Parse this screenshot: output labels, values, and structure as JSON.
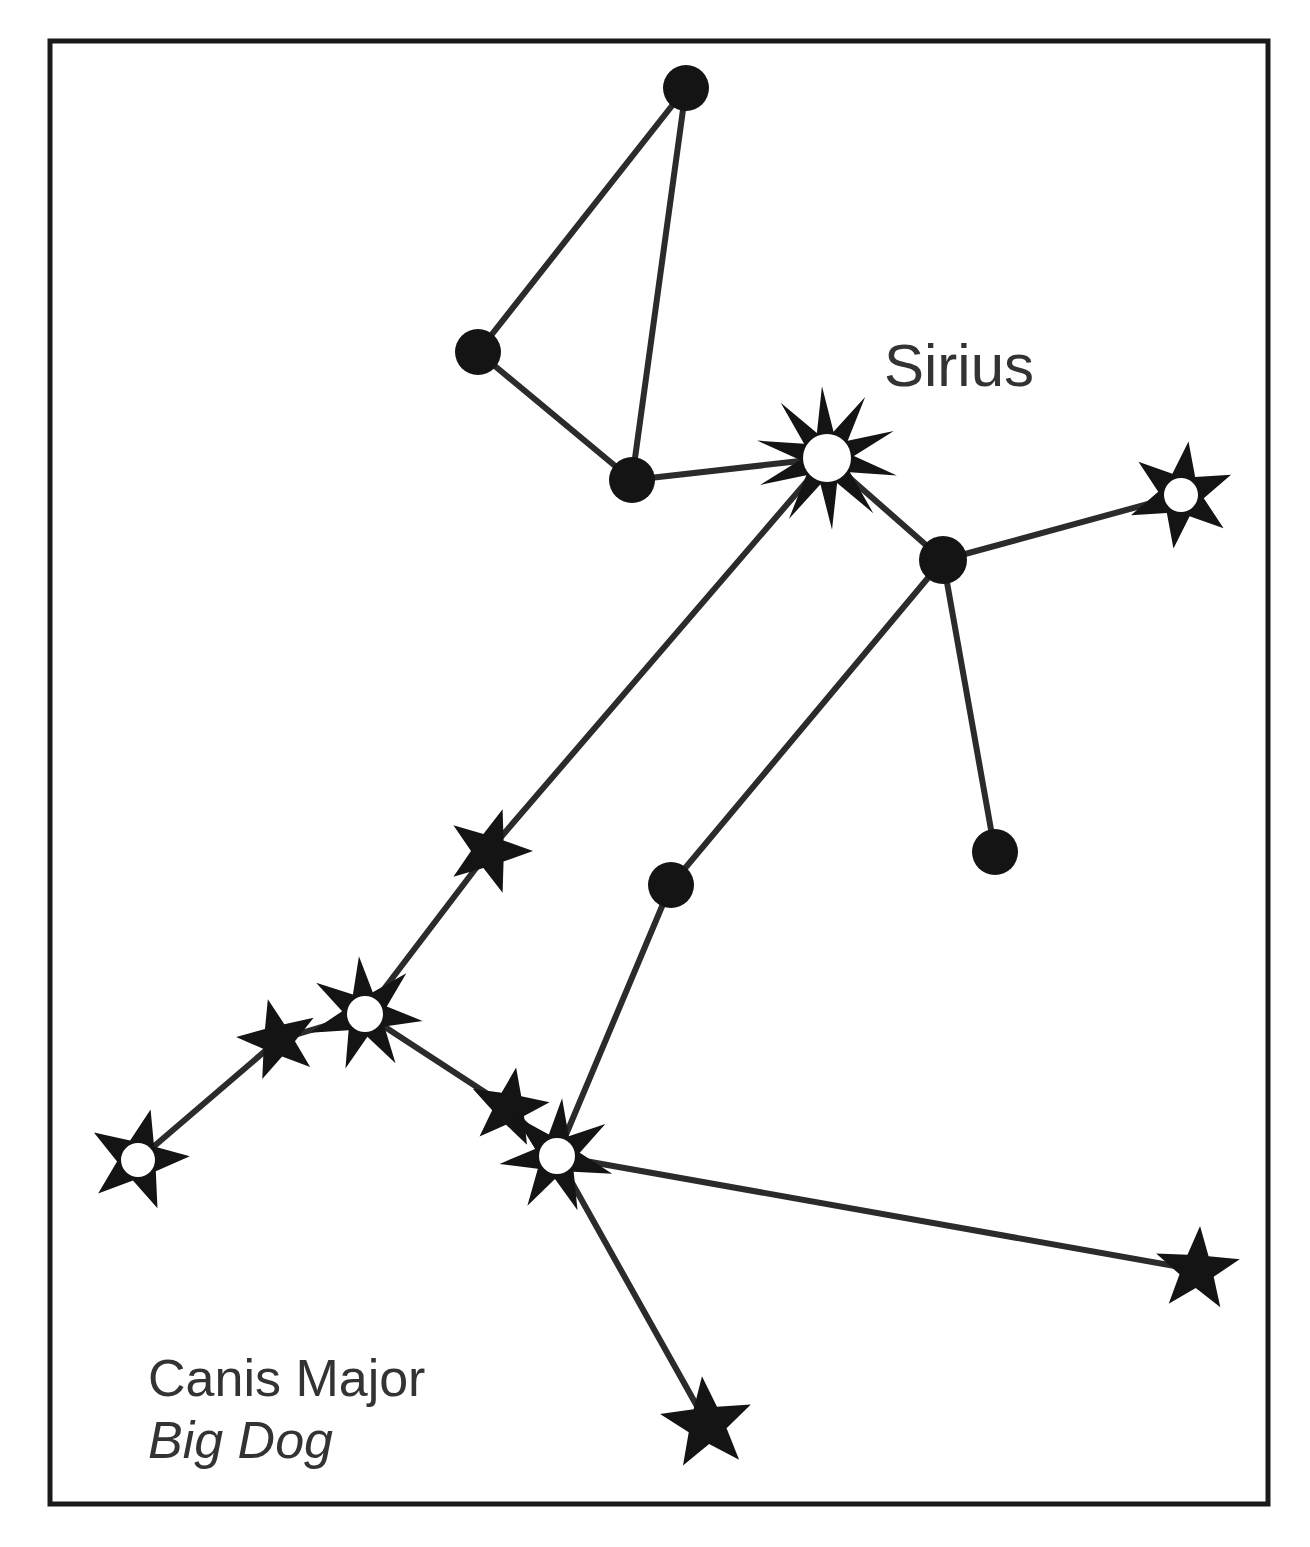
{
  "figure": {
    "background_color": "#ffffff",
    "ink_color": "#141414",
    "line_color": "#2b2b2b",
    "text_color": "#333333",
    "frame": {
      "x": 50,
      "y": 41,
      "width": 1218,
      "height": 1463,
      "stroke_width": 5
    }
  },
  "labels": {
    "sirius": "Sirius",
    "constellation_name": "Canis Major",
    "common_name": "Big Dog"
  },
  "label_positions": {
    "sirius": {
      "x": 884,
      "y": 386
    },
    "constellation_name": {
      "x": 148,
      "y": 1396
    },
    "common_name": {
      "x": 148,
      "y": 1458
    }
  },
  "chart_data": {
    "type": "scatter",
    "title": "Canis Major",
    "subtitle": "Big Dog",
    "xlabel": "",
    "ylabel": "",
    "grid": false,
    "legend": "none",
    "nodes": [
      {
        "id": "n1",
        "name": "theta-cmaj",
        "x": 686,
        "y": 88,
        "glyph": "dot",
        "radius": 23,
        "label": ""
      },
      {
        "id": "n2",
        "name": "gamma-cmaj",
        "x": 478,
        "y": 352,
        "glyph": "dot",
        "radius": 23,
        "label": ""
      },
      {
        "id": "n3",
        "name": "iota-cmaj",
        "x": 632,
        "y": 480,
        "glyph": "dot",
        "radius": 23,
        "label": ""
      },
      {
        "id": "n4",
        "name": "sirius",
        "x": 827,
        "y": 458,
        "glyph": "star",
        "points": 10,
        "outer": 72,
        "inner": 27,
        "core": 24,
        "rotation": -4,
        "label": "Sirius"
      },
      {
        "id": "n5",
        "name": "hub-node",
        "x": 943,
        "y": 560,
        "glyph": "dot",
        "radius": 24,
        "label": ""
      },
      {
        "id": "n6",
        "name": "theta-right",
        "x": 1181,
        "y": 495,
        "glyph": "star",
        "points": 6,
        "outer": 54,
        "inner": 23,
        "core": 17,
        "rotation": 8,
        "label": ""
      },
      {
        "id": "n7",
        "name": "eta-lower",
        "x": 995,
        "y": 852,
        "glyph": "dot",
        "radius": 23,
        "label": ""
      },
      {
        "id": "n8",
        "name": "mid-node",
        "x": 671,
        "y": 885,
        "glyph": "dot",
        "radius": 23,
        "label": ""
      },
      {
        "id": "n9",
        "name": "upper-chain",
        "x": 489,
        "y": 851,
        "glyph": "star",
        "points": 5,
        "outer": 44,
        "inner": 18,
        "core": 0,
        "rotation": 18,
        "label": ""
      },
      {
        "id": "n10",
        "name": "delta-cmaj",
        "x": 365,
        "y": 1014,
        "glyph": "star",
        "points": 7,
        "outer": 58,
        "inner": 23,
        "core": 18,
        "rotation": -6,
        "label": ""
      },
      {
        "id": "n11",
        "name": "omicron-cmaj",
        "x": 278,
        "y": 1040,
        "glyph": "star",
        "points": 5,
        "outer": 42,
        "inner": 17,
        "core": 0,
        "rotation": -14,
        "label": ""
      },
      {
        "id": "n12",
        "name": "zeta-cmaj",
        "x": 138,
        "y": 1160,
        "glyph": "star",
        "points": 5,
        "outer": 52,
        "inner": 21,
        "core": 17,
        "rotation": 14,
        "label": ""
      },
      {
        "id": "n13",
        "name": "kappa-cmaj",
        "x": 509,
        "y": 1108,
        "glyph": "star",
        "points": 5,
        "outer": 41,
        "inner": 17,
        "core": 0,
        "rotation": 10,
        "label": ""
      },
      {
        "id": "n14",
        "name": "adhara",
        "x": 557,
        "y": 1156,
        "glyph": "star",
        "points": 7,
        "outer": 58,
        "inner": 23,
        "core": 18,
        "rotation": 5,
        "label": ""
      },
      {
        "id": "n15",
        "name": "eta-right",
        "x": 1197,
        "y": 1270,
        "glyph": "star",
        "points": 5,
        "outer": 44,
        "inner": 18,
        "core": 0,
        "rotation": 4,
        "label": ""
      },
      {
        "id": "n16",
        "name": "foot-star",
        "x": 707,
        "y": 1424,
        "glyph": "star",
        "points": 5,
        "outer": 48,
        "inner": 20,
        "core": 0,
        "rotation": -6,
        "label": ""
      }
    ],
    "edges": [
      {
        "from": "n1",
        "to": "n2"
      },
      {
        "from": "n1",
        "to": "n3"
      },
      {
        "from": "n2",
        "to": "n3"
      },
      {
        "from": "n3",
        "to": "n4"
      },
      {
        "from": "n4",
        "to": "n5"
      },
      {
        "from": "n5",
        "to": "n6"
      },
      {
        "from": "n5",
        "to": "n7"
      },
      {
        "from": "n5",
        "to": "n8"
      },
      {
        "from": "n8",
        "to": "n14"
      },
      {
        "from": "n4",
        "to": "n9"
      },
      {
        "from": "n9",
        "to": "n10"
      },
      {
        "from": "n10",
        "to": "n11"
      },
      {
        "from": "n11",
        "to": "n12"
      },
      {
        "from": "n10",
        "to": "n13"
      },
      {
        "from": "n13",
        "to": "n14"
      },
      {
        "from": "n14",
        "to": "n15"
      },
      {
        "from": "n14",
        "to": "n16"
      }
    ]
  }
}
